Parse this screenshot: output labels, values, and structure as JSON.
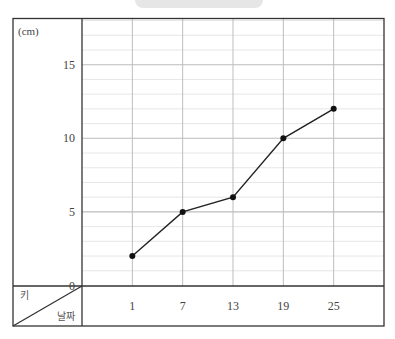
{
  "title": {
    "text": "",
    "visible_note": "title pill cropped at top; text not legible"
  },
  "axes": {
    "y_unit": "(cm)",
    "y_header": "키",
    "x_header": "날짜",
    "y_ticks": [
      "0",
      "5",
      "10",
      "15"
    ],
    "x_ticks": [
      "1",
      "7",
      "13",
      "19",
      "25"
    ]
  },
  "colors": {
    "grid_minor": "#e3e3e3",
    "grid_major": "#bdbdbd",
    "border": "#333333",
    "line": "#222222",
    "point": "#111111",
    "title_pill": "#e6e6e6"
  },
  "chart_data": {
    "type": "line",
    "title": "",
    "xlabel": "날짜",
    "ylabel": "키 (cm)",
    "categories": [
      "1",
      "7",
      "13",
      "19",
      "25"
    ],
    "x": [
      1,
      7,
      13,
      19,
      25
    ],
    "series": [
      {
        "name": "키",
        "values": [
          2,
          5,
          6,
          10,
          12
        ]
      }
    ],
    "ylim": [
      0,
      18
    ],
    "y_ticks": [
      0,
      5,
      10,
      15
    ],
    "y_minor_step": 1,
    "grid": true,
    "legend": "none"
  }
}
